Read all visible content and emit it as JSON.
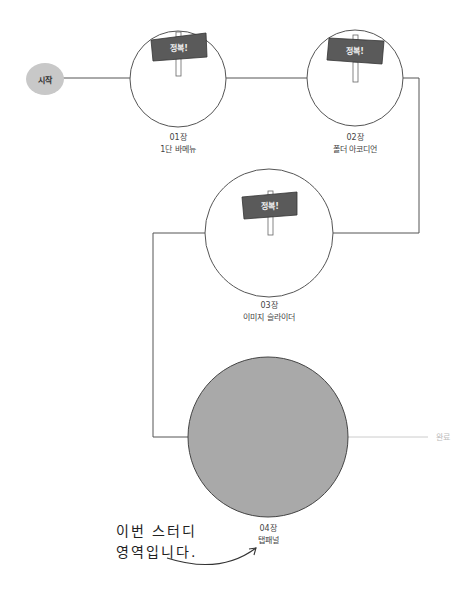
{
  "start": {
    "label": "시작"
  },
  "end": {
    "label": "완료"
  },
  "colors": {
    "line": "#555555",
    "end_line": "#cccccc",
    "current_fill": "#a9a9a9",
    "sign_fill": "#5a5a5a",
    "start_fill": "#c8c8c8"
  },
  "stages": [
    {
      "chapter": "01장",
      "title": "1단 바메뉴",
      "status": "정복!",
      "completed": true
    },
    {
      "chapter": "02장",
      "title": "폴더 아코디언",
      "status": "정복!",
      "completed": true
    },
    {
      "chapter": "03장",
      "title": "이미지 슬라이더",
      "status": "정복!",
      "completed": true
    },
    {
      "chapter": "04장",
      "title": "탭패널",
      "status": "",
      "completed": false,
      "current": true
    }
  ],
  "note": {
    "line1": "이번 스터디",
    "line2": "영역입니다."
  }
}
